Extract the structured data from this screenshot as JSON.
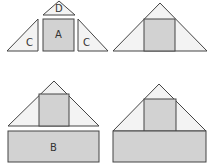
{
  "colors": {
    "square_fill": "#d2d2d2",
    "triangle_fill": "#f3f3f3",
    "stroke": "#454545",
    "label": "#333333"
  },
  "panels": {
    "top_left": {
      "description": "Separated pieces: triangle D, square A, two triangles C",
      "labels": {
        "d": "D",
        "a": "A",
        "c_left": "C",
        "c_right": "C"
      }
    },
    "top_right": {
      "description": "Pieces assembled into a large triangle with square in center"
    },
    "bottom_left": {
      "description": "Assembled triangle above separate rectangle B",
      "labels": {
        "b": "B"
      }
    },
    "bottom_right": {
      "description": "Triangle assembled on top of rectangle forming house shape"
    }
  }
}
